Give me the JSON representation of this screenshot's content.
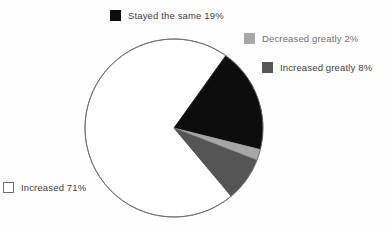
{
  "chart_data": {
    "type": "pie",
    "title": "",
    "subtitle": "",
    "xlabel": "",
    "ylabel": "",
    "grid": false,
    "legend_position": "scattered-around-pie",
    "center": {
      "x": 174,
      "y": 128
    },
    "radius": 89,
    "start_angle_deg": 140,
    "direction": "clockwise",
    "categories": [
      "Increased",
      "Stayed the same",
      "Decreased greatly",
      "Increased greatly"
    ],
    "values": [
      71,
      19,
      2,
      8
    ],
    "units": "%",
    "slices": [
      {
        "label": "Increased",
        "value": 71,
        "value_text": "71%",
        "legend_text": "Increased 71%",
        "color": "#ffffff",
        "stroke": "#6e6e6e",
        "swatch_kind": "outlined",
        "sweep_deg": 255.6
      },
      {
        "label": "Stayed the same",
        "value": 19,
        "value_text": "19%",
        "legend_text": "Stayed the same 19%",
        "color": "#0d0d0d",
        "stroke": "#0d0d0d",
        "swatch_kind": "filled",
        "sweep_deg": 68.4
      },
      {
        "label": "Decreased greatly",
        "value": 2,
        "value_text": "2%",
        "legend_text": "Decreased greatly 2%",
        "color": "#a7a7a7",
        "stroke": "#a7a7a7",
        "swatch_kind": "filled",
        "sweep_deg": 7.2
      },
      {
        "label": "Increased greatly",
        "value": 8,
        "value_text": "8%",
        "legend_text": "Increased greatly 8%",
        "color": "#555555",
        "stroke": "#555555",
        "swatch_kind": "filled",
        "sweep_deg": 28.8
      }
    ]
  },
  "legend": {
    "stayed_the_same": {
      "text": "Stayed the same 19%",
      "color": "#0d0d0d"
    },
    "decreased_greatly": {
      "text": "Decreased greatly 2%",
      "color": "#a7a7a7"
    },
    "increased_greatly": {
      "text": "Increased greatly 8%",
      "color": "#555555"
    },
    "increased": {
      "text": "Increased 71%",
      "color": "#ffffff"
    }
  },
  "colors": {
    "background": "#fefefe",
    "outline": "#6e6e6e",
    "text": "#3f3f3f"
  }
}
